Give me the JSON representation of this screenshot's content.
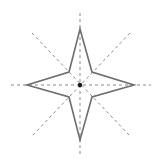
{
  "diagram": {
    "type": "four-pointed-star-construction",
    "center": {
      "x": 80,
      "y": 85
    },
    "colors": {
      "guide": "#8a8a8a",
      "star": "#6e6e6e",
      "center": "#1a1a1a",
      "background": "#ffffff"
    },
    "guides": [
      {
        "name": "vertical",
        "x1": 80,
        "y1": 13,
        "x2": 80,
        "y2": 156
      },
      {
        "name": "horizontal",
        "x1": 11,
        "y1": 85,
        "x2": 151,
        "y2": 85
      },
      {
        "name": "diagonal-tl-br",
        "x1": 32,
        "y1": 33,
        "x2": 130,
        "y2": 136
      },
      {
        "name": "diagonal-tr-bl",
        "x1": 130,
        "y1": 33,
        "x2": 32,
        "y2": 136
      }
    ],
    "star_points": [
      [
        80,
        29
      ],
      [
        92,
        72
      ],
      [
        134,
        85
      ],
      [
        92,
        97
      ],
      [
        80,
        140
      ],
      [
        69,
        97
      ],
      [
        27,
        85
      ],
      [
        69,
        72
      ]
    ]
  }
}
